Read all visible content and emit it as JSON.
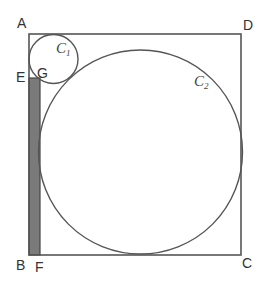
{
  "diagram": {
    "points": {
      "A": "A",
      "B": "B",
      "C": "C",
      "D": "D",
      "E": "E",
      "F": "F",
      "G": "G"
    },
    "circles": {
      "c1": {
        "letter": "C",
        "sub": "1"
      },
      "c2": {
        "letter": "C",
        "sub": "2"
      }
    },
    "colors": {
      "stroke": "#555555",
      "shade": "#7a7a7a",
      "text": "#333333"
    }
  }
}
